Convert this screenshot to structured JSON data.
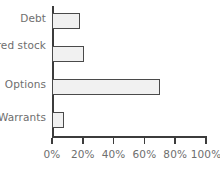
{
  "chart_data": {
    "type": "bar",
    "orientation": "horizontal",
    "title": "",
    "xlabel": "",
    "ylabel": "",
    "categories": [
      "Debt",
      "Preferred stock",
      "Options",
      "Warrants"
    ],
    "values": [
      18,
      21,
      70,
      8
    ],
    "value_unit": "%",
    "xlim": [
      0,
      100
    ],
    "xticks": [
      0,
      20,
      40,
      60,
      80,
      100
    ],
    "xtick_labels": [
      "0%",
      "20%",
      "40%",
      "60%",
      "80%",
      "100%"
    ],
    "grid": false,
    "legend": null,
    "colors": {
      "bar_fill": "#f1f1f1",
      "bar_edge": "#4a4a4a",
      "axis": "#3c3c3c",
      "text": "#6e6e6e",
      "background": "#ffffff"
    }
  }
}
